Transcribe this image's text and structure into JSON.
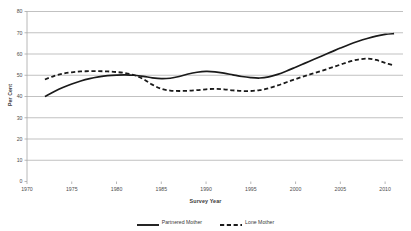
{
  "chart_data": {
    "type": "line",
    "title": "",
    "xlabel": "Survey Year",
    "ylabel": "Per Cent",
    "xlim": [
      1970,
      2012
    ],
    "ylim": [
      0,
      80
    ],
    "ytick_step": 10,
    "xtick_step": 5,
    "xticks": [
      "1970",
      "1975",
      "1980",
      "1985",
      "1990",
      "1995",
      "2000",
      "2005",
      "2010"
    ],
    "yticks": [
      "0",
      "10",
      "20",
      "30",
      "40",
      "50",
      "60",
      "70",
      "80"
    ],
    "grid": "horizontal",
    "legend_position": "bottom",
    "series": [
      {
        "name": "Partnered Mother",
        "style": "solid",
        "color": "#1a1a1a",
        "x": [
          1972,
          1973,
          1974,
          1975,
          1976,
          1977,
          1978,
          1979,
          1980,
          1981,
          1982,
          1983,
          1984,
          1985,
          1986,
          1987,
          1988,
          1989,
          1990,
          1991,
          1992,
          1993,
          1994,
          1995,
          1996,
          1997,
          1998,
          1999,
          2000,
          2001,
          2002,
          2003,
          2004,
          2005,
          2006,
          2007,
          2008,
          2009,
          2010,
          2011
        ],
        "values": [
          40.0,
          42.2,
          44.2,
          45.9,
          47.3,
          48.4,
          49.2,
          49.8,
          50.1,
          50.2,
          50.0,
          49.5,
          48.8,
          48.4,
          48.6,
          49.4,
          50.6,
          51.4,
          51.8,
          51.6,
          51.0,
          50.2,
          49.4,
          48.9,
          48.7,
          49.2,
          50.4,
          52.0,
          53.8,
          55.6,
          57.4,
          59.2,
          61.0,
          62.8,
          64.5,
          66.0,
          67.3,
          68.4,
          69.2,
          69.6
        ]
      },
      {
        "name": "Lone Mother",
        "style": "dashed",
        "color": "#1a1a1a",
        "x": [
          1972,
          1973,
          1974,
          1975,
          1976,
          1977,
          1978,
          1979,
          1980,
          1981,
          1982,
          1983,
          1984,
          1985,
          1986,
          1987,
          1988,
          1989,
          1990,
          1991,
          1992,
          1993,
          1994,
          1995,
          1996,
          1997,
          1998,
          1999,
          2000,
          2001,
          2002,
          2003,
          2004,
          2005,
          2006,
          2007,
          2008,
          2009,
          2010,
          2011
        ],
        "values": [
          48.0,
          49.6,
          50.7,
          51.4,
          51.8,
          51.9,
          51.9,
          51.8,
          51.5,
          51.0,
          50.0,
          48.2,
          45.6,
          43.6,
          42.8,
          42.6,
          42.7,
          43.0,
          43.4,
          43.6,
          43.4,
          42.9,
          42.6,
          42.6,
          43.0,
          43.9,
          45.2,
          46.7,
          48.2,
          49.6,
          50.9,
          52.2,
          53.6,
          55.0,
          56.4,
          57.4,
          57.8,
          57.2,
          55.8,
          54.6
        ]
      }
    ]
  },
  "legend": [
    {
      "label": "Partnered Mother",
      "style": "solid"
    },
    {
      "label": "Lone Mother",
      "style": "dashed"
    }
  ]
}
